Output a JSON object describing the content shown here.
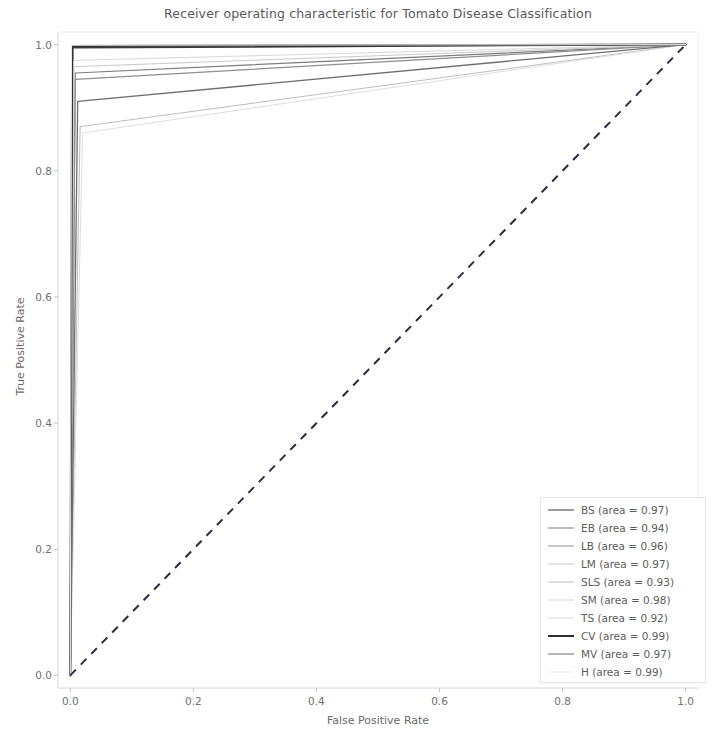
{
  "chart_data": {
    "type": "line",
    "title": "Receiver operating characteristic for Tomato Disease Classification",
    "xlabel": "False Positive Rate",
    "ylabel": "True Positive Rate",
    "xlim": [
      -0.02,
      1.02
    ],
    "ylim": [
      -0.02,
      1.02
    ],
    "xticks": [
      "0.0",
      "0.2",
      "0.4",
      "0.6",
      "0.8",
      "1.0"
    ],
    "xtick_values": [
      0.0,
      0.2,
      0.4,
      0.6,
      0.8,
      1.0
    ],
    "yticks": [
      "0.0",
      "0.2",
      "0.4",
      "0.6",
      "0.8",
      "1.0"
    ],
    "ytick_values": [
      0.0,
      0.2,
      0.4,
      0.6,
      0.8,
      1.0
    ],
    "grid": false,
    "legend_position": "lower right",
    "reference_line": {
      "label": "chance diagonal",
      "style": "dashed",
      "color": "#2b2b44",
      "x": [
        0.0,
        1.0
      ],
      "y": [
        0.0,
        1.0
      ]
    },
    "series": [
      {
        "name": "BS",
        "area": 0.97,
        "legend_label": "BS (area = 0.97)",
        "color": "#3b3b3b",
        "linewidth": 1.6,
        "x": [
          0.0,
          0.004,
          1.0
        ],
        "y": [
          0.0,
          0.995,
          1.0
        ]
      },
      {
        "name": "EB",
        "area": 0.94,
        "legend_label": "EB (area = 0.94)",
        "color": "#7d7d7d",
        "linewidth": 1.2,
        "x": [
          0.0,
          0.008,
          1.0
        ],
        "y": [
          0.0,
          0.955,
          1.0
        ]
      },
      {
        "name": "LB",
        "area": 0.96,
        "legend_label": "LB (area = 0.96)",
        "color": "#8f8f8f",
        "linewidth": 1.2,
        "x": [
          0.0,
          0.008,
          1.0
        ],
        "y": [
          0.0,
          0.945,
          1.0
        ]
      },
      {
        "name": "LM",
        "area": 0.97,
        "legend_label": "LM (area = 0.97)",
        "color": "#c9c9c9",
        "linewidth": 1.0,
        "x": [
          0.0,
          0.006,
          1.0
        ],
        "y": [
          0.0,
          0.965,
          1.0
        ]
      },
      {
        "name": "SLS",
        "area": 0.93,
        "legend_label": "SLS (area = 0.93)",
        "color": "#bdbdbd",
        "linewidth": 1.0,
        "x": [
          0.0,
          0.016,
          1.0
        ],
        "y": [
          0.0,
          0.87,
          1.0
        ]
      },
      {
        "name": "SM",
        "area": 0.98,
        "legend_label": "SM (area = 0.98)",
        "color": "#d8d8d8",
        "linewidth": 1.0,
        "x": [
          0.0,
          0.005,
          1.0
        ],
        "y": [
          0.0,
          0.975,
          1.0
        ]
      },
      {
        "name": "TS",
        "area": 0.92,
        "legend_label": "TS (area = 0.92)",
        "color": "#dedede",
        "linewidth": 1.0,
        "x": [
          0.0,
          0.02,
          1.0
        ],
        "y": [
          0.0,
          0.86,
          1.0
        ]
      },
      {
        "name": "CV",
        "area": 0.99,
        "legend_label": "CV (area = 0.99)",
        "color": "#2f2f2f",
        "linewidth": 2.0,
        "x": [
          0.0,
          0.003,
          1.0
        ],
        "y": [
          0.0,
          0.998,
          1.0
        ]
      },
      {
        "name": "MV",
        "area": 0.97,
        "legend_label": "MV (area = 0.97)",
        "color": "#6e6e6e",
        "linewidth": 1.3,
        "x": [
          0.0,
          0.012,
          1.0
        ],
        "y": [
          0.0,
          0.91,
          1.0
        ]
      },
      {
        "name": "H",
        "area": 0.99,
        "legend_label": "H (area = 0.99)",
        "color": "#ededed",
        "linewidth": 1.0,
        "x": [
          0.0,
          0.002,
          1.0
        ],
        "y": [
          0.0,
          0.999,
          1.0
        ]
      }
    ]
  }
}
